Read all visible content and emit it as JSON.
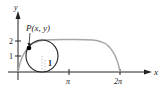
{
  "diagram": {
    "type": "cycloid",
    "axes": {
      "x_label": "x",
      "y_label": "y",
      "x_ticks": [
        "π",
        "2π"
      ],
      "y_ticks": [
        "1",
        "2"
      ]
    },
    "point_label": "P(x, y)",
    "radius_label": "1",
    "colors": {
      "curve": "#a6a6a6",
      "axis": "#222222",
      "circle": "#222222",
      "point": "#000000"
    }
  }
}
